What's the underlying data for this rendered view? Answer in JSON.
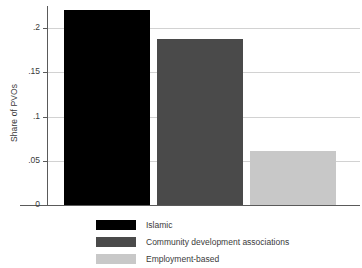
{
  "chart_data": {
    "type": "bar",
    "title": "",
    "xlabel": "",
    "ylabel": "Share of PVOs",
    "categories": [
      "Islamic",
      "Community development associations",
      "Employment-based"
    ],
    "values": [
      0.221,
      0.188,
      0.061
    ],
    "ylim": [
      0,
      0.225
    ],
    "yticks": [
      0,
      0.05,
      0.1,
      0.15,
      0.2
    ],
    "ytick_labels": [
      "0",
      ".05",
      ".1",
      ".15",
      ".2"
    ],
    "xtick_labels": [],
    "grid": "horizontal",
    "legend_position": "below",
    "series_colors": [
      "#000000",
      "#4a4a4a",
      "#c8c8c8"
    ],
    "grid_color": "#d2d2d2",
    "axis_color": "#5a5a5a",
    "background": "#ffffff"
  }
}
